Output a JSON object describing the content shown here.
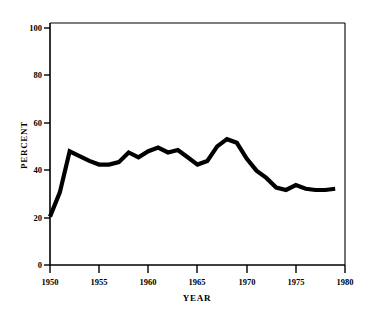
{
  "chart_data": {
    "type": "line",
    "title": "",
    "xlabel": "YEAR",
    "ylabel": "PERCENT",
    "xlim": [
      1950,
      1980
    ],
    "ylim": [
      0,
      100
    ],
    "grid": false,
    "legend": null,
    "xticks": [
      1950,
      1955,
      1960,
      1965,
      1970,
      1975,
      1980
    ],
    "xtick_labels": [
      "1950",
      "1955",
      "1960",
      "1965",
      "1970",
      "1975",
      "1980"
    ],
    "yticks": [
      0,
      20,
      40,
      60,
      80,
      100
    ],
    "ytick_labels": [
      "0",
      "20",
      "40",
      "60",
      "80",
      "100"
    ],
    "series": [
      {
        "name": "percent",
        "x": [
          1950,
          1951,
          1952,
          1953,
          1954,
          1955,
          1956,
          1957,
          1958,
          1959,
          1960,
          1961,
          1962,
          1963,
          1964,
          1965,
          1966,
          1967,
          1968,
          1969,
          1970,
          1971,
          1972,
          1973,
          1974,
          1975,
          1976,
          1977,
          1978,
          1979
        ],
        "values": [
          20,
          30,
          47,
          45,
          43,
          41.5,
          41.5,
          42.5,
          46.5,
          44.5,
          47,
          48.5,
          46.5,
          47.5,
          44.5,
          41.5,
          43,
          49,
          52,
          50.5,
          44,
          39,
          36,
          32,
          31,
          33,
          31.5,
          31,
          31,
          31.5
        ]
      }
    ]
  },
  "axes": {
    "y_axis_title": "PERCENT",
    "x_axis_title": "YEAR"
  }
}
